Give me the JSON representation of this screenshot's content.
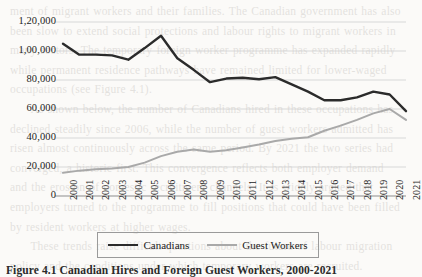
{
  "page": {
    "background_color": "#fbfaf8",
    "bleed_through_text": "ment of migrant workers and their families. The Canadian government has also\nbeen slow to extend social protections and labour rights to migrant workers in\nmany sectors. The temporary foreign worker programme has expanded rapidly\nwhile permanent residence pathways have remained limited for lower-waged\noccupations (see Figure 4.1).\n     As shown below, the number of Canadians hired in these occupations has\ndeclined steadily since 2006, while the number of guest workers admitted has\nrisen almost continuously across the same period. By 2021 the two series had\nconverged, a historic first. This convergence reflects both employer demand\nand the erosion of domestic recruitment channels. It is widely argued that\nemployers turned to the programme to fill positions that could have been filled\nby resident workers at higher wages.\n     These trends raise difficult questions about the future of labour migration\npolicy and the conditions under which temporary workers are recruited."
  },
  "caption": {
    "text": "Figure 4.1 Canadian Hires and Foreign Guest Workers, 2000-2021"
  },
  "chart_data": {
    "type": "line",
    "title": "",
    "xlabel": "",
    "ylabel": "",
    "grid": true,
    "legend_position": "bottom",
    "ylim": [
      0,
      120000
    ],
    "yticks": [
      0,
      20000,
      40000,
      60000,
      80000,
      100000,
      120000
    ],
    "ytick_labels": [
      "0",
      "20,000",
      "40,000",
      "60,000",
      "80,000",
      "1,00,000",
      "1,20,000"
    ],
    "categories": [
      "2000",
      "2001",
      "2002",
      "2003",
      "2004",
      "2005",
      "2006",
      "2007",
      "2008",
      "2009",
      "2010",
      "2011",
      "2012",
      "2013",
      "2014",
      "2015",
      "2016",
      "2017",
      "2018",
      "2019",
      "2020",
      "2021"
    ],
    "series": [
      {
        "name": "Canadians",
        "color": "#2b2b2b",
        "values": [
          105000,
          97500,
          97500,
          97000,
          94000,
          102000,
          110500,
          95000,
          87000,
          78500,
          81000,
          81500,
          80500,
          82000,
          77000,
          72000,
          66000,
          66000,
          68000,
          72000,
          70000,
          58500
        ]
      },
      {
        "name": "Guest Workers",
        "color": "#a9a9a9",
        "values": [
          16000,
          17500,
          18500,
          19000,
          20000,
          23000,
          27500,
          30500,
          32000,
          30500,
          31500,
          33500,
          35500,
          38000,
          39500,
          40500,
          45000,
          48500,
          52500,
          57000,
          60000,
          52500
        ]
      }
    ],
    "note": "The two series converge at 2021 near 58,000."
  },
  "legend": {
    "items": [
      {
        "label": "Canadians",
        "style": "dark"
      },
      {
        "label": "Guest Workers",
        "style": "gray"
      }
    ]
  }
}
